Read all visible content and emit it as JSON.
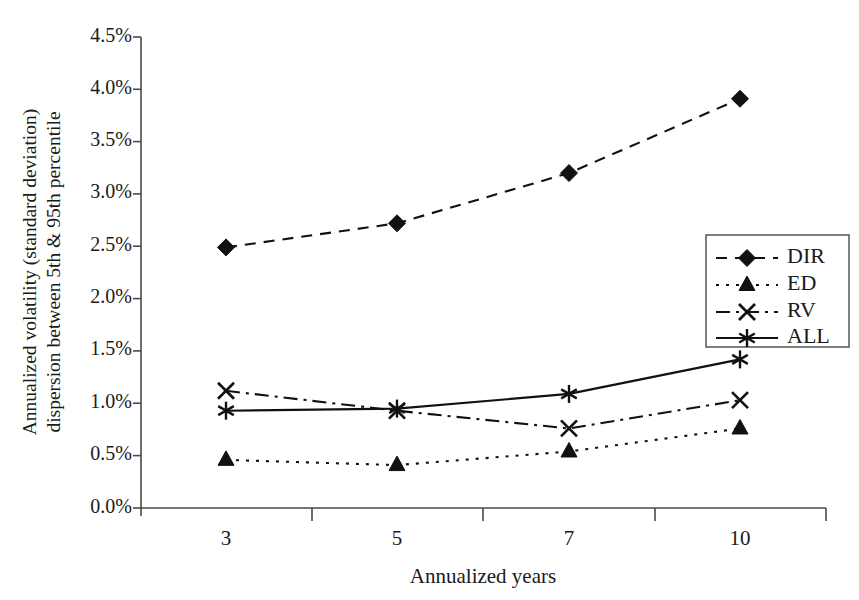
{
  "chart_data": {
    "type": "line",
    "title": "",
    "xlabel": "Annualized years",
    "ylabel": "Annualized volatility (standard  deviation) dispersion between 5th & 95th percentile",
    "ylabel_line1": "Annualized volatility (standard  deviation)",
    "ylabel_line2": "dispersion between 5th & 95th percentile",
    "categories": [
      "3",
      "5",
      "7",
      "10"
    ],
    "x": [
      3,
      5,
      7,
      10
    ],
    "ylim": [
      0,
      4.5
    ],
    "ytick_labels": [
      "0.0%",
      "0.5%",
      "1.0%",
      "1.5%",
      "2.0%",
      "2.5%",
      "3.0%",
      "3.5%",
      "4.0%",
      "4.5%"
    ],
    "ytick_values": [
      0.0,
      0.5,
      1.0,
      1.5,
      2.0,
      2.5,
      3.0,
      3.5,
      4.0,
      4.5
    ],
    "grid": false,
    "legend_position": "right",
    "series": [
      {
        "name": "DIR",
        "values": [
          2.49,
          2.72,
          3.2,
          3.91
        ],
        "marker": "diamond",
        "dash": "dashed",
        "color": "#111111"
      },
      {
        "name": "ED",
        "values": [
          0.46,
          0.41,
          0.54,
          0.76
        ],
        "marker": "triangle",
        "dash": "dotted",
        "color": "#111111"
      },
      {
        "name": "RV",
        "values": [
          1.12,
          0.93,
          0.76,
          1.03
        ],
        "marker": "x",
        "dash": "dashdot",
        "color": "#111111"
      },
      {
        "name": "ALL",
        "values": [
          0.93,
          0.95,
          1.09,
          1.42
        ],
        "marker": "star",
        "dash": "solid",
        "color": "#111111"
      }
    ]
  },
  "legend": {
    "items": [
      {
        "label": "DIR"
      },
      {
        "label": "ED"
      },
      {
        "label": "RV"
      },
      {
        "label": "ALL"
      }
    ]
  },
  "axes": {
    "x_title": "Annualized years",
    "y_title_line1": "Annualized volatility (standard  deviation)",
    "y_title_line2": "dispersion between 5th & 95th percentile"
  }
}
